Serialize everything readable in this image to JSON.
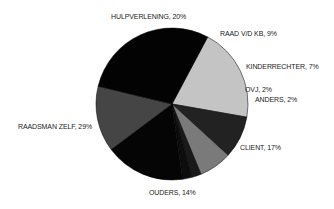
{
  "chart_data": {
    "type": "pie",
    "title": "",
    "start_angle_deg": -62,
    "direction": "clockwise",
    "slices": [
      {
        "label": "HULPVERLENING",
        "value": 20,
        "display": "HULPVERLENING, 20%",
        "color": "#c4c4c4"
      },
      {
        "label": "RAAD V/D KB",
        "value": 9,
        "display": "RAAD V/D KB, 9%",
        "color": "#222222"
      },
      {
        "label": "KINDERRECHTER",
        "value": 7,
        "display": "KINDERRECHTER, 7%",
        "color": "#7a7a7a"
      },
      {
        "label": "OVJ",
        "value": 2,
        "display": "OVJ, 2%",
        "color": "#1a1a1a"
      },
      {
        "label": "ANDERS",
        "value": 2,
        "display": "ANDERS, 2%",
        "color": "#0d0d0d"
      },
      {
        "label": "CLIENT",
        "value": 17,
        "display": "CLIENT, 17%",
        "color": "#050505"
      },
      {
        "label": "OUDERS",
        "value": 14,
        "display": "OUDERS, 14%",
        "color": "#454545"
      },
      {
        "label": "RAADSMAN ZELF",
        "value": 29,
        "display": "RAADSMAN ZELF, 29%",
        "color": "#030303"
      }
    ],
    "legend": "none",
    "data_labels": "outside, category name and percentage"
  },
  "labels": {
    "hulpverlening": "HULPVERLENING, 20%",
    "raad": "RAAD V/D KB, 9%",
    "kinderrechter": "KINDERRECHTER, 7%",
    "ovj": "OVJ, 2%",
    "anders": "ANDERS, 2%",
    "client": "CLIENT, 17%",
    "ouders": "OUDERS, 14%",
    "raadsman": "RAADSMAN ZELF, 29%"
  }
}
